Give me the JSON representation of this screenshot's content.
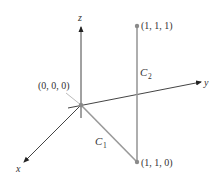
{
  "diagram": {
    "axes": {
      "x": {
        "label": "x"
      },
      "y": {
        "label": "y"
      },
      "z": {
        "label": "z"
      }
    },
    "points": [
      {
        "label": "(0, 0, 0)"
      },
      {
        "label": "(1, 1, 1)"
      },
      {
        "label": "(1, 1, 0)"
      }
    ],
    "curves": [
      {
        "label": "C",
        "subscript": "1",
        "description": "segment from (0,0,0) to (1,1,0)"
      },
      {
        "label": "C",
        "subscript": "2",
        "description": "segment from (1,1,0) to (1,1,1)"
      }
    ],
    "colors": {
      "axis": "#333333",
      "curve": "#9a9a9a",
      "point": "#8a8a8a",
      "text": "#333333"
    }
  }
}
